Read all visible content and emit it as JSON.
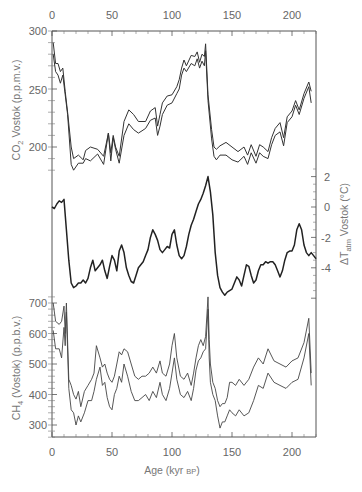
{
  "chart_data": [
    {
      "type": "line",
      "title": "",
      "panel": "top",
      "ylabel": "CO2 Vostok (p.p.m.v.)",
      "yticks": [
        200,
        250,
        300
      ],
      "ylim": [
        170,
        300
      ],
      "xlabel": "Age (kyr BP)",
      "xticks": [
        0,
        50,
        100,
        150,
        200
      ],
      "xlim": [
        0,
        220
      ],
      "series": [
        {
          "name": "CO2 upper envelope",
          "x": [
            1,
            3,
            5,
            7,
            9,
            11,
            13,
            16,
            18,
            22,
            26,
            28,
            32,
            38,
            43,
            47,
            49,
            51,
            53,
            56,
            60,
            64,
            68,
            72,
            75,
            78,
            82,
            86,
            88,
            90,
            92,
            96,
            100,
            104,
            106,
            108,
            110,
            112,
            116,
            119,
            121,
            123,
            125,
            127,
            128,
            130,
            133,
            135,
            137,
            140,
            145,
            150,
            155,
            160,
            163,
            166,
            170,
            173,
            176,
            180,
            183,
            186,
            190,
            193,
            196,
            200,
            203,
            206,
            210,
            214,
            216
          ],
          "values": [
            290,
            272,
            272,
            265,
            268,
            248,
            230,
            200,
            190,
            193,
            189,
            197,
            200,
            198,
            192,
            212,
            195,
            210,
            200,
            192,
            222,
            232,
            228,
            222,
            222,
            222,
            231,
            234,
            218,
            228,
            238,
            244,
            245,
            252,
            258,
            268,
            275,
            270,
            279,
            278,
            282,
            273,
            280,
            278,
            289,
            245,
            215,
            200,
            198,
            201,
            204,
            200,
            196,
            200,
            193,
            202,
            192,
            202,
            200,
            196,
            208,
            216,
            221,
            208,
            226,
            231,
            240,
            232,
            246,
            256,
            248
          ]
        },
        {
          "name": "CO2 lower envelope",
          "x": [
            1,
            3,
            5,
            7,
            9,
            11,
            13,
            16,
            18,
            22,
            26,
            28,
            32,
            38,
            43,
            47,
            49,
            51,
            53,
            56,
            60,
            64,
            68,
            72,
            75,
            78,
            82,
            86,
            88,
            90,
            92,
            96,
            100,
            104,
            106,
            108,
            110,
            112,
            116,
            119,
            121,
            123,
            125,
            127,
            128,
            130,
            133,
            135,
            137,
            140,
            145,
            150,
            155,
            160,
            163,
            166,
            170,
            173,
            176,
            180,
            183,
            186,
            190,
            193,
            196,
            200,
            203,
            206,
            210,
            214,
            216
          ],
          "values": [
            280,
            265,
            262,
            255,
            262,
            245,
            228,
            185,
            180,
            186,
            186,
            190,
            188,
            194,
            185,
            212,
            188,
            208,
            198,
            186,
            210,
            220,
            215,
            212,
            214,
            216,
            223,
            225,
            210,
            218,
            228,
            236,
            238,
            246,
            250,
            262,
            268,
            265,
            272,
            270,
            276,
            268,
            274,
            270,
            283,
            240,
            207,
            192,
            189,
            193,
            193,
            189,
            187,
            192,
            185,
            195,
            186,
            195,
            192,
            190,
            202,
            210,
            213,
            201,
            221,
            226,
            236,
            228,
            242,
            252,
            238
          ]
        }
      ]
    },
    {
      "type": "line",
      "panel": "middle",
      "ylabel": "ΔTatm Vostok (°C)",
      "yticks": [
        -4,
        -2,
        0,
        2
      ],
      "ylim": [
        -6,
        2.5
      ],
      "xlim": [
        0,
        220
      ],
      "series": [
        {
          "name": "ΔTatm",
          "x": [
            0,
            2,
            4,
            6,
            8,
            10,
            12,
            14,
            16,
            18,
            20,
            22,
            24,
            26,
            28,
            30,
            32,
            34,
            36,
            38,
            40,
            42,
            44,
            46,
            48,
            50,
            52,
            54,
            56,
            58,
            60,
            62,
            64,
            66,
            68,
            70,
            72,
            74,
            76,
            78,
            80,
            82,
            84,
            86,
            88,
            90,
            92,
            94,
            96,
            98,
            100,
            102,
            104,
            106,
            108,
            110,
            112,
            114,
            116,
            118,
            120,
            122,
            124,
            126,
            128,
            130,
            132,
            134,
            136,
            138,
            140,
            142,
            144,
            146,
            148,
            150,
            152,
            154,
            156,
            158,
            160,
            162,
            164,
            166,
            168,
            170,
            172,
            174,
            176,
            178,
            180,
            182,
            184,
            186,
            188,
            190,
            192,
            194,
            196,
            198,
            200,
            202,
            204,
            206,
            208,
            210,
            212,
            214,
            216,
            218,
            220
          ],
          "values": [
            0.0,
            -0.1,
            0.2,
            0.4,
            0.3,
            0.5,
            -1.5,
            -3.5,
            -5.0,
            -5.3,
            -5.2,
            -5.0,
            -5.0,
            -4.8,
            -5.0,
            -4.7,
            -4.0,
            -3.5,
            -4.2,
            -4.0,
            -3.8,
            -3.5,
            -4.2,
            -4.7,
            -3.9,
            -3.2,
            -3.5,
            -4.2,
            -2.9,
            -2.5,
            -3.0,
            -4.0,
            -4.5,
            -4.9,
            -5.0,
            -4.5,
            -4.0,
            -3.8,
            -3.6,
            -3.2,
            -2.8,
            -2.0,
            -1.5,
            -1.8,
            -2.2,
            -2.8,
            -3.0,
            -2.8,
            -2.6,
            -2.7,
            -1.8,
            -1.5,
            -2.5,
            -3.2,
            -3.4,
            -3.2,
            -2.6,
            -1.8,
            -1.2,
            -0.8,
            -0.3,
            0.2,
            0.5,
            0.9,
            1.4,
            2.0,
            1.0,
            -0.5,
            -3.0,
            -4.5,
            -5.3,
            -5.6,
            -5.8,
            -5.6,
            -5.5,
            -5.4,
            -5.0,
            -4.6,
            -4.8,
            -5.2,
            -4.5,
            -3.8,
            -3.9,
            -4.5,
            -5.0,
            -4.8,
            -4.2,
            -3.8,
            -3.8,
            -3.6,
            -3.7,
            -3.6,
            -3.6,
            -3.8,
            -4.2,
            -4.6,
            -4.2,
            -3.5,
            -3.0,
            -2.9,
            -2.9,
            -2.5,
            -1.5,
            -1.1,
            -1.5,
            -2.5,
            -3.0,
            -3.2,
            -3.0,
            -3.2,
            -3.4
          ]
        }
      ]
    },
    {
      "type": "line",
      "panel": "bottom",
      "ylabel": "CH4 (Vostok) (p.p.b.v.)",
      "yticks": [
        300,
        400,
        500,
        600,
        700
      ],
      "ylim": [
        260,
        720
      ],
      "xlabel": "Age (kyr BP)",
      "xticks": [
        0,
        50,
        100,
        150,
        200
      ],
      "xlim": [
        0,
        220
      ],
      "series": [
        {
          "name": "CH4 upper envelope",
          "x": [
            1,
            3,
            6,
            8,
            10,
            11,
            12,
            14,
            16,
            18,
            20,
            22,
            24,
            27,
            30,
            33,
            35,
            37,
            40,
            42,
            44,
            46,
            48,
            50,
            52,
            54,
            56,
            58,
            60,
            63,
            66,
            69,
            72,
            75,
            78,
            81,
            84,
            87,
            90,
            92,
            95,
            98,
            100,
            102,
            104,
            107,
            110,
            113,
            116,
            118,
            120,
            122,
            124,
            126,
            128,
            130,
            131,
            132,
            134,
            136,
            138,
            140,
            142,
            144,
            146,
            148,
            150,
            153,
            156,
            160,
            164,
            168,
            172,
            176,
            180,
            185,
            190,
            195,
            200,
            205,
            210,
            214,
            216
          ],
          "values": [
            700,
            640,
            630,
            640,
            690,
            600,
            700,
            450,
            430,
            400,
            385,
            410,
            360,
            410,
            430,
            450,
            470,
            560,
            520,
            490,
            500,
            470,
            450,
            440,
            460,
            500,
            540,
            530,
            550,
            540,
            500,
            460,
            450,
            460,
            460,
            470,
            490,
            470,
            510,
            470,
            460,
            500,
            560,
            600,
            520,
            460,
            450,
            470,
            430,
            470,
            520,
            560,
            580,
            560,
            590,
            720,
            580,
            500,
            440,
            420,
            380,
            360,
            370,
            370,
            390,
            440,
            440,
            430,
            450,
            430,
            450,
            490,
            520,
            500,
            550,
            510,
            500,
            490,
            510,
            520,
            570,
            650,
            470
          ]
        },
        {
          "name": "CH4 lower envelope",
          "x": [
            1,
            3,
            6,
            8,
            10,
            11,
            12,
            14,
            16,
            18,
            20,
            22,
            24,
            27,
            30,
            33,
            35,
            37,
            40,
            42,
            44,
            46,
            48,
            50,
            52,
            54,
            56,
            58,
            60,
            63,
            66,
            69,
            72,
            75,
            78,
            81,
            84,
            87,
            90,
            92,
            95,
            98,
            100,
            102,
            104,
            107,
            110,
            113,
            116,
            118,
            120,
            122,
            124,
            126,
            128,
            130,
            131,
            132,
            134,
            136,
            138,
            140,
            142,
            144,
            146,
            148,
            150,
            153,
            156,
            160,
            164,
            168,
            172,
            176,
            180,
            185,
            190,
            195,
            200,
            205,
            210,
            214,
            216
          ],
          "values": [
            610,
            550,
            550,
            520,
            620,
            560,
            670,
            420,
            350,
            340,
            300,
            330,
            310,
            340,
            380,
            380,
            410,
            450,
            490,
            430,
            440,
            390,
            360,
            350,
            400,
            420,
            460,
            440,
            500,
            460,
            410,
            380,
            380,
            390,
            400,
            380,
            410,
            390,
            440,
            400,
            380,
            420,
            470,
            520,
            450,
            400,
            390,
            410,
            380,
            420,
            480,
            510,
            520,
            540,
            550,
            680,
            520,
            440,
            400,
            380,
            330,
            290,
            310,
            310,
            330,
            350,
            340,
            330,
            350,
            330,
            340,
            380,
            430,
            420,
            470,
            440,
            430,
            420,
            440,
            450,
            520,
            600,
            430
          ]
        }
      ]
    }
  ],
  "axes": {
    "top_x_ticks": [
      "0",
      "50",
      "100",
      "150",
      "200"
    ],
    "bottom_x_ticks": [
      "0",
      "50",
      "100",
      "150",
      "200"
    ],
    "xlabel": "Age (kyr ",
    "xlabel_unit": "BP",
    "xlabel_close": ")",
    "co2_ticks": [
      "300",
      "250",
      "200"
    ],
    "co2_label_main": "CO",
    "co2_label_sub": "2",
    "co2_label_rest": " Vostok (p.p.m.v.)",
    "temp_ticks": [
      "2",
      "0",
      "-2",
      "-4"
    ],
    "temp_label_main": "ΔT",
    "temp_label_sub": "atm",
    "temp_label_rest": " Vostok (°C)",
    "ch4_ticks": [
      "700",
      "600",
      "500",
      "400",
      "300"
    ],
    "ch4_label_main": "CH",
    "ch4_label_sub": "4",
    "ch4_label_rest": " (Vostok) (p.p.b.v.)"
  }
}
